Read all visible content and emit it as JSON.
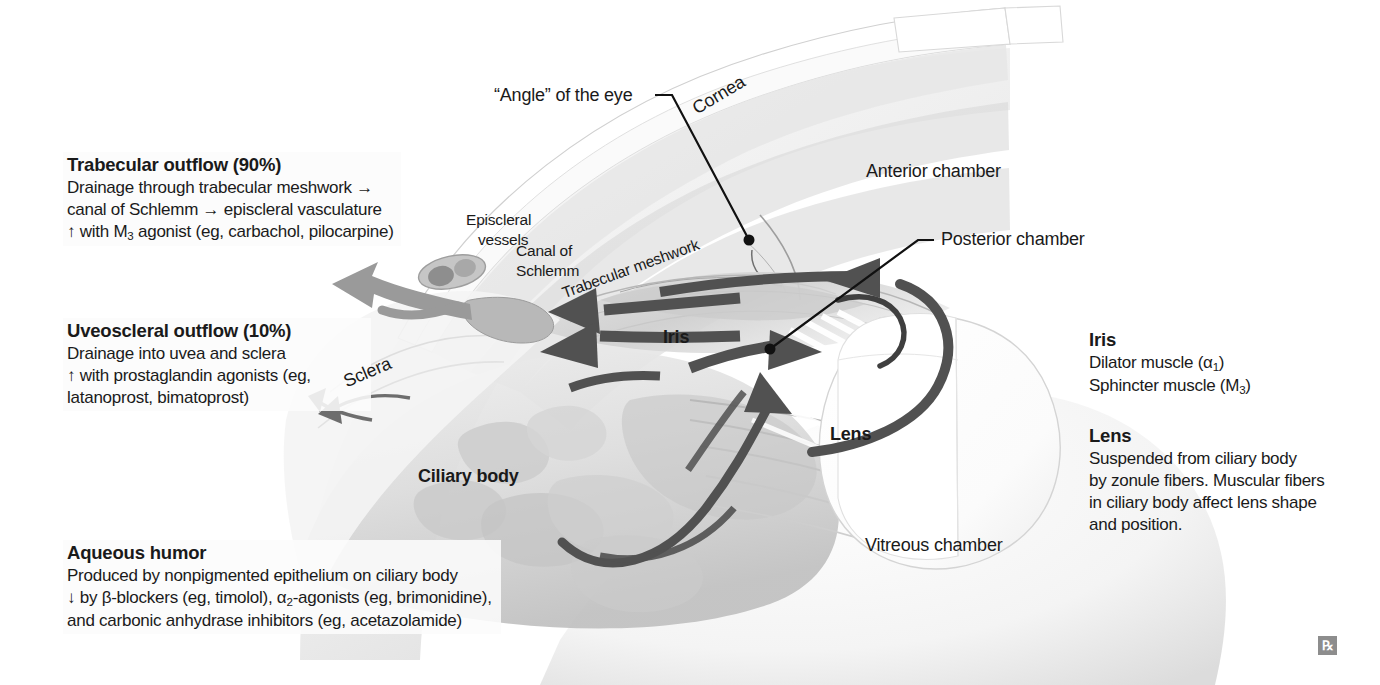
{
  "figure": {
    "rx_mark": "℞"
  },
  "callouts": {
    "angle": "“Angle” of the eye",
    "cornea": "Cornea",
    "anterior_chamber": "Anterior chamber",
    "posterior_chamber": "Posterior chamber",
    "episcleral_vessels_l1": "Episcleral",
    "episcleral_vessels_l2": "vessels",
    "canal_of_schlemm_l1": "Canal of",
    "canal_of_schlemm_l2": "Schlemm",
    "trabecular_meshwork": "Trabecular meshwork",
    "sclera": "Sclera",
    "iris": "Iris",
    "ciliary_body": "Ciliary body",
    "lens": "Lens",
    "vitreous_chamber": "Vitreous chamber"
  },
  "blocks": {
    "trabecular": {
      "heading": "Trabecular outflow (90%)",
      "line1": "Drainage through trabecular meshwork →",
      "line2": "canal of Schlemm → episcleral vasculature",
      "line3_pre": "↑ with M",
      "line3_sub": "3",
      "line3_post": " agonist (eg, carbachol, pilocarpine)"
    },
    "uveoscleral": {
      "heading": "Uveoscleral outflow (10%)",
      "line1": "Drainage into uvea and sclera",
      "line2": "↑ with prostaglandin agonists (eg,",
      "line3": "latanoprost, bimatoprost)"
    },
    "aqueous": {
      "heading": "Aqueous humor",
      "line1": "Produced by nonpigmented epithelium on ciliary body",
      "line2_a": "↓ by β-blockers (eg, timolol), α",
      "line2_sub": "2",
      "line2_b": "-agonists (eg, brimonidine),",
      "line3": "and carbonic anhydrase inhibitors (eg, acetazolamide)"
    },
    "iris_info": {
      "heading": "Iris",
      "line1_pre": "Dilator muscle (α",
      "line1_sub": "1",
      "line1_post": ")",
      "line2_pre": "Sphincter muscle (M",
      "line2_sub": "3",
      "line2_post": ")"
    },
    "lens_info": {
      "heading": "Lens",
      "line1": "Suspended from ciliary body",
      "line2": "by zonule fibers. Muscular fibers",
      "line3": "in ciliary body affect lens shape",
      "line4": "and position."
    }
  },
  "colors": {
    "background": "#ffffff",
    "text": "#1a1a1a",
    "arrow_dark": "#4f4f4f",
    "arrow_mid": "#6e6e6e",
    "arrow_light": "#9a9a9a",
    "tissue_light": "#e9e9e9",
    "tissue_mid": "#d2d2d2",
    "tissue_dark": "#b4b4b4",
    "outline": "#bdbdbd",
    "rx_badge": "#8d8d8d"
  }
}
